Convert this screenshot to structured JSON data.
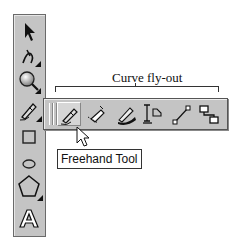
{
  "annotation": {
    "caption": "Curve fly-out"
  },
  "toolbox": {
    "tools": [
      {
        "name": "Pick Tool",
        "icon": "arrow-pointer-icon",
        "has_flyout": false
      },
      {
        "name": "Shape Tool",
        "icon": "shape-node-icon",
        "has_flyout": true
      },
      {
        "name": "Zoom Tool",
        "icon": "magnifier-icon",
        "has_flyout": true
      },
      {
        "name": "Curve Tool",
        "icon": "freehand-pen-icon",
        "has_flyout": true
      },
      {
        "name": "Rectangle Tool",
        "icon": "rectangle-icon",
        "has_flyout": false
      },
      {
        "name": "Ellipse Tool",
        "icon": "ellipse-icon",
        "has_flyout": false
      },
      {
        "name": "Polygon Tool",
        "icon": "pentagon-icon",
        "has_flyout": true
      },
      {
        "name": "Text Tool",
        "icon": "text-a-icon",
        "has_flyout": false
      }
    ]
  },
  "flyout": {
    "tools": [
      {
        "name": "Freehand Tool",
        "icon": "freehand-pen-icon",
        "active": true
      },
      {
        "name": "Bezier Tool",
        "icon": "bezier-pen-icon",
        "active": false
      },
      {
        "name": "Artistic Media Tool",
        "icon": "artistic-media-icon",
        "active": false
      },
      {
        "name": "Dimension Tool",
        "icon": "dimension-icon",
        "active": false
      },
      {
        "name": "Connector Line Tool",
        "icon": "connector-line-icon",
        "active": false
      },
      {
        "name": "Interactive Connector Tool",
        "icon": "connector-boxes-icon",
        "active": false
      }
    ]
  },
  "tooltip": {
    "text": "Freehand Tool"
  },
  "colors": {
    "toolbar_bg": "#c4c4c4",
    "border": "#555555",
    "tooltip_bg": "#ffffff"
  }
}
